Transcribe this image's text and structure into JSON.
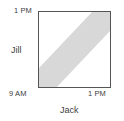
{
  "figure": {
    "name": "jack-jill-meeting-time-square",
    "background_color": "#ffffff"
  },
  "axes": {
    "x": {
      "title": "Jack",
      "min_label": "9 AM",
      "max_label": "1 PM"
    },
    "y": {
      "title": "Jill",
      "min_label": "9 AM",
      "max_label": "1 PM"
    }
  },
  "colors": {
    "band_fill": "#d8d8d8",
    "band_edge": "#6e6e6e",
    "frame": "#555555",
    "text": "#3d3d3d",
    "plot_background": "#ffffff"
  },
  "chart_data": {
    "type": "area",
    "title": "",
    "subtitle": "",
    "xlabel": "Jack",
    "ylabel": "Jill",
    "xlim": [
      0,
      4
    ],
    "ylim": [
      0,
      4
    ],
    "xtick_labels": [
      "9 AM",
      "1 PM"
    ],
    "ytick_labels": [
      "9 AM",
      "1 PM"
    ],
    "xticks": [
      0,
      4
    ],
    "yticks": [
      0,
      4
    ],
    "grid": false,
    "legend": false,
    "annotations": [],
    "regions": [
      {
        "name": "overlap-band",
        "description": "Diagonal shaded band |x - y| <= 1 hour clipped to the 4-hour by 4-hour square",
        "fill": "#d8d8d8",
        "edge": "#6e6e6e",
        "boundary_lines": [
          {
            "name": "upper-edge",
            "equation": "y = x + 1",
            "from": [
              0,
              1
            ],
            "to": [
              3,
              4
            ]
          },
          {
            "name": "lower-edge",
            "equation": "y = x - 1",
            "from": [
              1,
              0
            ],
            "to": [
              4,
              3
            ]
          }
        ],
        "vertices": [
          [
            0,
            1
          ],
          [
            3,
            4
          ],
          [
            4,
            4
          ],
          [
            4,
            3
          ],
          [
            1,
            0
          ],
          [
            0,
            0
          ]
        ]
      }
    ]
  }
}
